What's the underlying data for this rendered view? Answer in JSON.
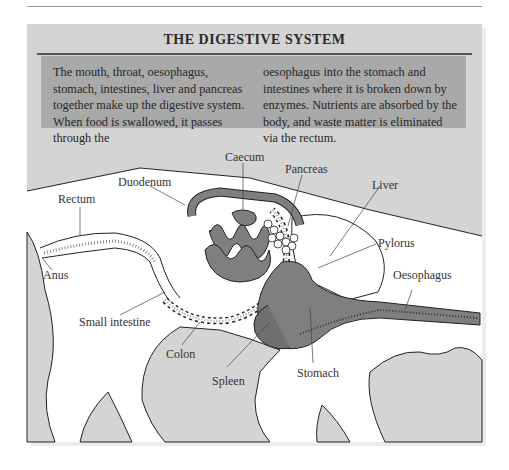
{
  "figure": {
    "title": "THE DIGESTIVE SYSTEM",
    "description_col1": "The mouth, throat, oesophagus, stomach, intestines, liver and pancreas together make up the digestive system. When food is swallowed, it passes through the",
    "description_col2": "oesophagus into the stomach and intestines where it is broken down by enzymes. Nutrients are absorbed by the body, and waste matter is eliminated via the rectum."
  },
  "labels": {
    "caecum": "Caecum",
    "pancreas": "Pancreas",
    "duodenum": "Duodenum",
    "liver": "Liver",
    "rectum": "Rectum",
    "pylorus": "Pylorus",
    "oesophagus": "Oesophagus",
    "anus": "Anus",
    "small_intestine": "Small intestine",
    "colon": "Colon",
    "spleen": "Spleen",
    "stomach": "Stomach"
  },
  "colors": {
    "panel_bg": "#d4d4d4",
    "textbox_bg": "#a9a9a9",
    "organ_fill": "#7f7f7f",
    "body_fill": "#ffffff"
  }
}
